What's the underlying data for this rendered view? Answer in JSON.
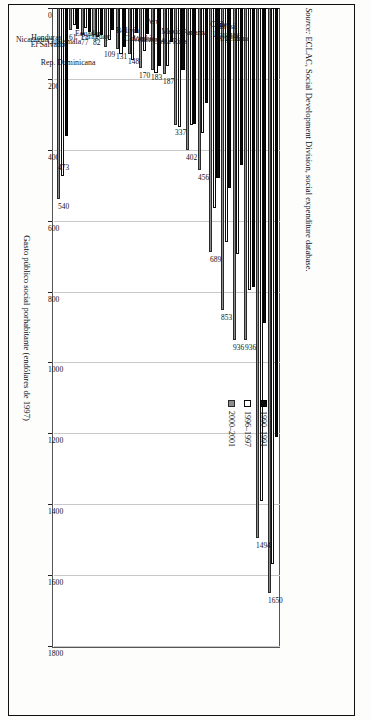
{
  "figure": {
    "orientation": "rotated-90",
    "source_note_prefix": "Source:",
    "source_note": "ECLAC, Social Development Division, social expenditure database."
  },
  "legend": {
    "position": "inside-top-right",
    "items": [
      {
        "label": "1990–1991",
        "swatch": "k",
        "color": "#0b0b0b"
      },
      {
        "label": "1996–1997",
        "swatch": "w",
        "color": "#ffffff"
      },
      {
        "label": "2000–2001",
        "swatch": "g",
        "color": "#8d8d8d"
      }
    ]
  },
  "chart_data": {
    "type": "bar",
    "title": "",
    "xlabel": "Gasto público social porhabitante (endólares de 1997)",
    "ylabel": "",
    "ylim": [
      0,
      1800
    ],
    "ticks": [
      0,
      200,
      400,
      600,
      800,
      1000,
      1200,
      1400,
      1600,
      1800
    ],
    "grid": true,
    "categories": [
      "Argentina",
      "Uruguay",
      "Brasil",
      "Chile",
      "Panamá",
      "Costa Rica",
      "México",
      "Venezuela",
      "Colombia",
      "Perú",
      "Bolivia",
      "Rep. Dominicana",
      "Paraguay",
      "Ecuador",
      "Guatemala",
      "El Salvador",
      "Honduras",
      "Nicaragua",
      "América Latina a/"
    ],
    "series": [
      {
        "name": "1990–1991",
        "values": [
          1211,
          888,
          786,
          442,
          509,
          479,
          268,
          326,
          176,
          96,
          163,
          72,
          71,
          109,
          63,
          77,
          67,
          59,
          360
        ]
      },
      {
        "name": "1996–1997",
        "values": [
          1570,
          1390,
          796,
          694,
          660,
          565,
          352,
          331,
          337,
          164,
          183,
          120,
          148,
          131,
          91,
          82,
          57,
          47,
          473
        ]
      },
      {
        "name": "2000–2001",
        "values": [
          1650,
          1494,
          936,
          936,
          853,
          689,
          456,
          402,
          331,
          187,
          176,
          170,
          131,
          117,
          109,
          77,
          77,
          61,
          540
        ]
      }
    ],
    "data_labels": [
      {
        "category": "Argentina",
        "value": "1650"
      },
      {
        "category": "Uruguay",
        "value": "1494"
      },
      {
        "category": "Brasil",
        "value": "936"
      },
      {
        "category": "Chile",
        "value": "936"
      },
      {
        "category": "Panamá",
        "value": "853"
      },
      {
        "category": "Costa Rica",
        "value": "689"
      },
      {
        "category": "México",
        "value": "456"
      },
      {
        "category": "Venezuela",
        "value": "402"
      },
      {
        "category": "Colombia",
        "value": "337"
      },
      {
        "category": "Perú",
        "value": "187"
      },
      {
        "category": "Bolivia",
        "value": "183"
      },
      {
        "category": "Rep. Dominicana",
        "value": "170"
      },
      {
        "category": "Paraguay",
        "value": "148"
      },
      {
        "category": "Ecuador",
        "value": "131"
      },
      {
        "category": "Guatemala",
        "value": "109"
      },
      {
        "category": "El Salvador",
        "value": "82"
      },
      {
        "category": "Honduras",
        "value": "77"
      },
      {
        "category": "Nicaragua",
        "value": "61"
      },
      {
        "category": "América Latina a/",
        "value": "540"
      },
      {
        "category": "América Latina a/",
        "value": "473"
      }
    ]
  }
}
